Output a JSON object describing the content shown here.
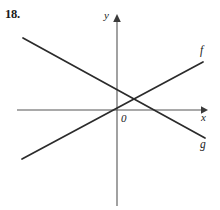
{
  "problem": {
    "number": "18."
  },
  "axes": {
    "y_label": "y",
    "x_label": "x",
    "origin_label": "0"
  },
  "curves": {
    "f_label": "f",
    "g_label": "g"
  },
  "colors": {
    "ink": "#2b2b2b",
    "axis": "#555555",
    "background": "#ffffff"
  },
  "chart_data": {
    "type": "line",
    "title": "",
    "xlabel": "x",
    "ylabel": "y",
    "grid": false,
    "legend": "inline-end-labels",
    "axis_arrows": [
      "y-up",
      "x-right"
    ],
    "origin_px": [
      117,
      110
    ],
    "xlim_px": [
      17,
      207
    ],
    "ylim_px": [
      14,
      206
    ],
    "series": [
      {
        "name": "f",
        "description": "increasing line through the origin",
        "slope_sign": "positive",
        "points_px": [
          [
            22,
            159
          ],
          [
            117,
            110
          ],
          [
            135,
            95
          ],
          [
            203,
            62
          ]
        ],
        "label_at_px": [
          200,
          45
        ],
        "y_intercept_px": 110,
        "x_intercept_px": 117
      },
      {
        "name": "g",
        "description": "decreasing line crossing the y-axis above the origin",
        "slope_sign": "negative",
        "points_px": [
          [
            23,
            38
          ],
          [
            117,
            87
          ],
          [
            135,
            95
          ],
          [
            205,
            138
          ]
        ],
        "label_at_px": [
          200,
          139
        ],
        "y_intercept_px": 87,
        "x_intercept_px": 156
      }
    ],
    "intersections": [
      {
        "curves": [
          "f",
          "g"
        ],
        "point_px": [
          135,
          95
        ]
      }
    ]
  }
}
